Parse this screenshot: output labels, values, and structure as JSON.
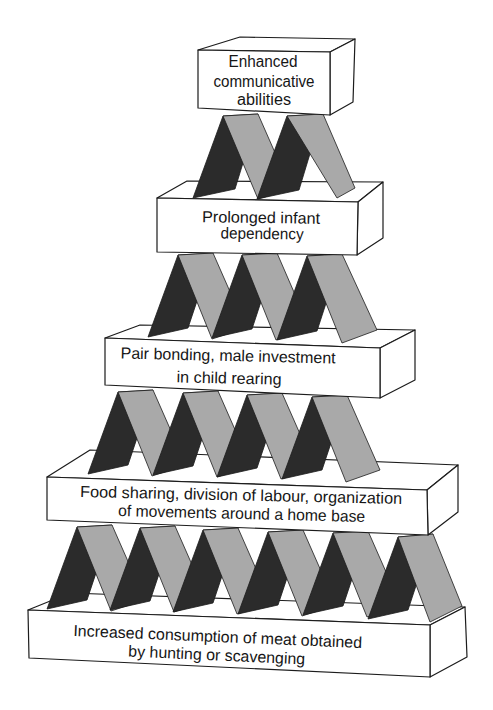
{
  "colors": {
    "card_dark": "#2b2b2b",
    "card_light": "#a9a9a9",
    "box_fill": "#ffffff",
    "stroke": "#1c1c1c",
    "text": "#161616"
  },
  "levels": [
    {
      "id": "top",
      "lines": [
        "Enhanced",
        "communicative",
        "abilities"
      ],
      "cards_below": 2
    },
    {
      "id": "level-2",
      "lines": [
        "Prolonged infant",
        "dependency"
      ],
      "cards_below": 3
    },
    {
      "id": "level-3",
      "lines": [
        "Pair bonding, male investment",
        "in child rearing"
      ],
      "cards_below": 4
    },
    {
      "id": "level-4",
      "lines": [
        "Food sharing, division of labour, organization",
        "of movements around a home base"
      ],
      "cards_below": 6
    },
    {
      "id": "base",
      "lines": [
        "Increased consumption of meat obtained",
        "by hunting or scavenging"
      ],
      "cards_below": 0
    }
  ]
}
